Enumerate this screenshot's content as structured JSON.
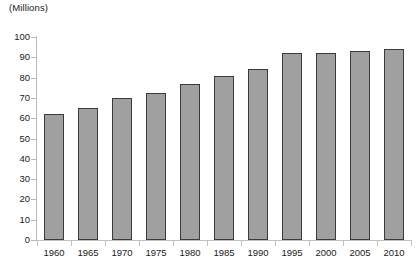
{
  "chart_data": {
    "type": "bar",
    "title": "",
    "subtitle": "",
    "units_label": "(Millions)",
    "xlabel": "",
    "ylabel": "",
    "ylim": [
      0,
      100
    ],
    "ytick_step": 10,
    "grid": false,
    "legend": null,
    "bar_fill_color": "#a0a0a0",
    "bar_border_color": "#3b3b3b",
    "axis_color": "#bdbdbd",
    "text_color": "#1a1a1a",
    "categories": [
      "1960",
      "1965",
      "1970",
      "1975",
      "1980",
      "1985",
      "1990",
      "1995",
      "2000",
      "2005",
      "2010"
    ],
    "values": [
      62,
      65,
      70,
      72.5,
      77,
      81,
      84,
      92,
      92,
      93,
      94
    ],
    "ytick_labels": [
      "0",
      "10",
      "20",
      "30",
      "40",
      "50",
      "60",
      "70",
      "80",
      "90",
      "100"
    ]
  }
}
